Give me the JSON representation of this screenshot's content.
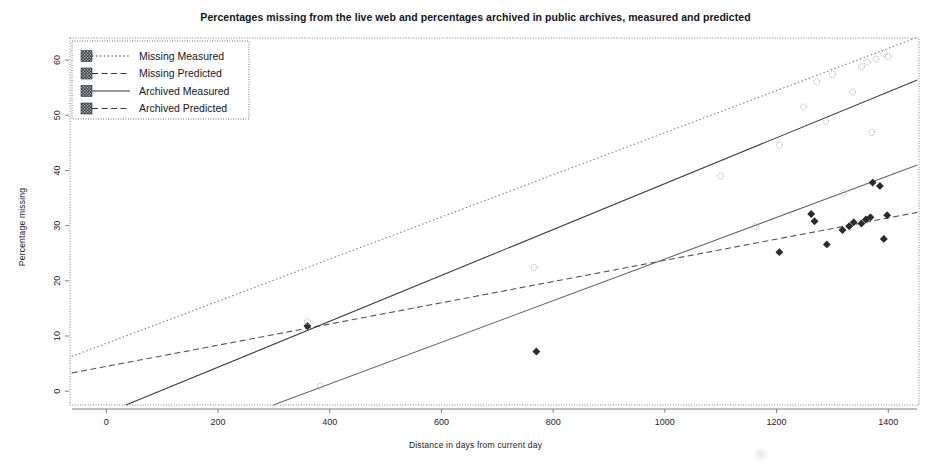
{
  "chart_data": {
    "type": "scatter",
    "title": "Percentages missing from the live web and percentages archived in public archives, measured and predicted",
    "xlabel": "Distance in days from current day",
    "ylabel": "Percentage missing",
    "xlim": [
      -65,
      1455
    ],
    "ylim": [
      -2.5,
      64
    ],
    "xticks": [
      0,
      200,
      400,
      600,
      800,
      1000,
      1200,
      1400
    ],
    "xticklabels": [
      "0",
      "200",
      "400",
      "600",
      "800",
      "1000",
      "1200",
      "1400"
    ],
    "yticks": [
      0,
      10,
      20,
      30,
      40,
      50,
      60
    ],
    "yticklabels": [
      "0",
      "10",
      "20",
      "30",
      "40",
      "50",
      "60"
    ],
    "grid": false,
    "legend_position": "top-left",
    "background": "#ffffff",
    "axis_color": "#7d8086",
    "series": [
      {
        "name": "Missing Measured",
        "kind": "scatter",
        "marker": "diamond",
        "marker_filled": true,
        "color": "#2b2b30",
        "points": [
          [
            360,
            11.8
          ],
          [
            770,
            7.2
          ],
          [
            1205,
            25.2
          ],
          [
            1262,
            32.1
          ],
          [
            1268,
            30.8
          ],
          [
            1290,
            26.6
          ],
          [
            1318,
            29.2
          ],
          [
            1330,
            29.9
          ],
          [
            1338,
            30.6
          ],
          [
            1352,
            30.4
          ],
          [
            1360,
            31.1
          ],
          [
            1368,
            31.5
          ],
          [
            1372,
            37.8
          ],
          [
            1385,
            37.2
          ],
          [
            1392,
            27.6
          ],
          [
            1398,
            31.9
          ]
        ]
      },
      {
        "name": "Archived Measured",
        "kind": "scatter",
        "marker": "circle",
        "marker_filled": false,
        "color": "#a9acb2",
        "points": [
          [
            360,
            12.6
          ],
          [
            383,
            0.9
          ],
          [
            766,
            22.4
          ],
          [
            1100,
            39.0
          ],
          [
            1162,
            29.8
          ],
          [
            1205,
            44.6
          ],
          [
            1248,
            51.5
          ],
          [
            1272,
            56.1
          ],
          [
            1288,
            48.9
          ],
          [
            1300,
            57.4
          ],
          [
            1320,
            36.0
          ],
          [
            1336,
            54.2
          ],
          [
            1352,
            58.8
          ],
          [
            1362,
            59.6
          ],
          [
            1370,
            46.9
          ],
          [
            1378,
            60.2
          ],
          [
            1392,
            61.1
          ],
          [
            1400,
            60.6
          ]
        ]
      },
      {
        "name": "Missing Predicted",
        "kind": "line",
        "linestyle": "dashed",
        "color": "#53565c",
        "endpoints": [
          [
            -62,
            3.3
          ],
          [
            1452,
            32.4
          ]
        ]
      },
      {
        "name": "Archived Predicted",
        "kind": "line",
        "linestyle": "dotted",
        "color": "#7f8288",
        "endpoints": [
          [
            -62,
            6.3
          ],
          [
            1452,
            64.1
          ]
        ]
      },
      {
        "name": "Missing Measured Fit",
        "kind": "line",
        "linestyle": "solid",
        "color": "#3a3d43",
        "endpoints": [
          [
            35,
            -2.5
          ],
          [
            1452,
            56.4
          ]
        ]
      },
      {
        "name": "Archived Measured Fit",
        "kind": "line",
        "linestyle": "solid",
        "color": "#64676d",
        "endpoints": [
          [
            299,
            -2.5
          ],
          [
            1452,
            41.0
          ]
        ]
      }
    ]
  },
  "legend": {
    "items": [
      {
        "label": "Missing Measured",
        "marker": "square-hatched",
        "linestyle": "dotted",
        "color": "#34373c"
      },
      {
        "label": "Missing Predicted",
        "marker": "square-hatched",
        "linestyle": "dashed",
        "color": "#34373c"
      },
      {
        "label": "Archived Measured",
        "marker": "square-hatched",
        "linestyle": "solid",
        "color": "#34373c"
      },
      {
        "label": "Archived Predicted",
        "marker": "square-hatched",
        "linestyle": "dashed",
        "color": "#34373c"
      }
    ]
  }
}
